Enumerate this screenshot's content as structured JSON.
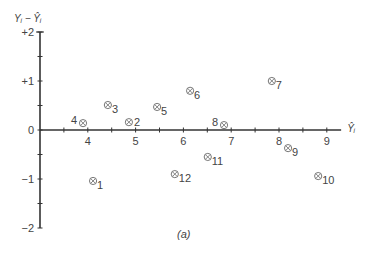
{
  "chart_data": {
    "type": "scatter",
    "title": "",
    "caption": "(a)",
    "xlabel": "Ŷᵢ",
    "ylabel": "Yᵢ − Ŷᵢ",
    "xlim": [
      3,
      9.3
    ],
    "ylim": [
      -2,
      2
    ],
    "x_ticks": [
      4,
      5,
      6,
      7,
      8,
      9
    ],
    "y_ticks": [
      "+2",
      "+1",
      "0",
      "−1",
      "−2"
    ],
    "y_tick_values": [
      2,
      1,
      0,
      -1,
      -2
    ],
    "minor_ticks": true,
    "grid": false,
    "legend": null,
    "marker": "circled-x",
    "points": [
      {
        "label": "1",
        "x": 4.11,
        "y": -1.04
      },
      {
        "label": "2",
        "x": 4.86,
        "y": 0.16
      },
      {
        "label": "3",
        "x": 4.42,
        "y": 0.51
      },
      {
        "label": "4",
        "x": 3.9,
        "y": 0.14
      },
      {
        "label": "5",
        "x": 5.45,
        "y": 0.47
      },
      {
        "label": "6",
        "x": 6.14,
        "y": 0.8
      },
      {
        "label": "7",
        "x": 7.85,
        "y": 1.0
      },
      {
        "label": "8",
        "x": 6.85,
        "y": 0.1
      },
      {
        "label": "9",
        "x": 8.19,
        "y": -0.37
      },
      {
        "label": "10",
        "x": 8.82,
        "y": -0.94
      },
      {
        "label": "11",
        "x": 6.51,
        "y": -0.55
      },
      {
        "label": "12",
        "x": 5.82,
        "y": -0.9
      }
    ],
    "label_positions": {
      "1": "right-below",
      "2": "right",
      "3": "right-below",
      "4": "left",
      "5": "right-below",
      "6": "right-below",
      "7": "right-below",
      "8": "left",
      "9": "right-below",
      "10": "right-below",
      "11": "right-below",
      "12": "right-below"
    }
  },
  "colors": {
    "axis": "#333333",
    "marker": "#666666",
    "text": "#444444"
  }
}
